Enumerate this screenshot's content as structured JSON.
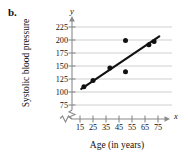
{
  "figure": {
    "panel_label": "b.",
    "x_axis_letter": "x",
    "y_axis_letter": "y"
  },
  "chart_data": {
    "type": "scatter",
    "title": "",
    "subtitle": "",
    "xlabel": "Age (in years)",
    "ylabel": "Systolic blood pressure",
    "xlim": [
      10,
      80
    ],
    "ylim": [
      70,
      232
    ],
    "xticks": [
      15,
      25,
      35,
      45,
      55,
      65,
      75
    ],
    "yticks": [
      75,
      100,
      125,
      150,
      175,
      200,
      225
    ],
    "xtick_labels": [
      "15",
      "25",
      "35",
      "45",
      "55",
      "65",
      "75"
    ],
    "ytick_labels": [
      "75",
      "100",
      "125",
      "150",
      "175",
      "200",
      "225"
    ],
    "grid": "horizontal",
    "axis_break_x": true,
    "axis_break_y": true,
    "legend": "none",
    "point_color": "#111111",
    "line_color": "#111111",
    "grid_color": "#c8c8c8",
    "axis_color": "#8a8a8a",
    "points": [
      {
        "x": 18,
        "y": 110
      },
      {
        "x": 25,
        "y": 122
      },
      {
        "x": 38,
        "y": 146
      },
      {
        "x": 50,
        "y": 199
      },
      {
        "x": 50,
        "y": 139
      },
      {
        "x": 68,
        "y": 191
      },
      {
        "x": 72,
        "y": 197
      }
    ],
    "series": [
      {
        "name": "Systolic blood pressure vs Age",
        "x": [
          18,
          25,
          38,
          50,
          50,
          68,
          72
        ],
        "values": [
          110,
          122,
          146,
          199,
          139,
          191,
          197
        ]
      }
    ],
    "trend_line": {
      "name": "line of best fit",
      "x1": 16,
      "y1": 106,
      "x2": 76,
      "y2": 207
    }
  }
}
